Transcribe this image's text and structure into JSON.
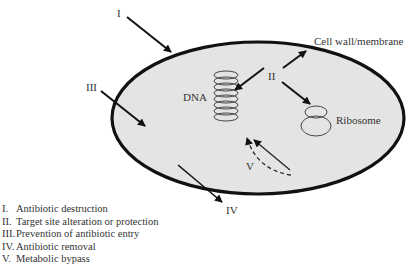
{
  "diagram": {
    "type": "cell-antibiotic-resistance-mechanisms",
    "cell_fill": "#e4e4e4",
    "outline_color": "#111111",
    "labels": {
      "I": "I",
      "II": "II",
      "III": "III",
      "IV": "IV",
      "V": "V",
      "dna": "DNA",
      "cell_wall": "Cell wall/membrane",
      "ribosome": "Ribosome"
    }
  },
  "legend": [
    {
      "num": "I.",
      "text": "Antibiotic destruction"
    },
    {
      "num": "II.",
      "text": "Target site alteration or protection"
    },
    {
      "num": "III.",
      "text": "Prevention of antibiotic entry"
    },
    {
      "num": "IV.",
      "text": "Antibiotic removal"
    },
    {
      "num": "V.",
      "text": "Metabolic bypass"
    }
  ]
}
